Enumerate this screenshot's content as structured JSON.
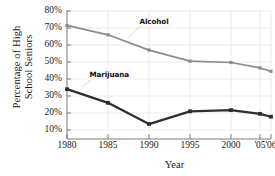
{
  "chart_data": {
    "type": "line",
    "title": "",
    "xlabel": "Year",
    "ylabel": "Percentage of High School Seniors",
    "ylabel_line1": "Percentage of High",
    "ylabel_line2": "School Seniors",
    "x": [
      1980,
      1985,
      1990,
      1995,
      2000,
      2005,
      2006
    ],
    "categories": [
      "1980",
      "1985",
      "1990",
      "1995",
      "2000",
      "'05",
      "'06"
    ],
    "xtick_labels": [
      "1980",
      "1985",
      "1990",
      "1995",
      "2000",
      "'05",
      "'06"
    ],
    "ytick_labels": [
      "80%",
      "70%",
      "60%",
      "50%",
      "40%",
      "30%",
      "20%",
      "10%"
    ],
    "ytick_values": [
      80,
      70,
      60,
      50,
      40,
      30,
      20,
      10
    ],
    "ylim": [
      5,
      83
    ],
    "grid": true,
    "grid_axis": "both",
    "legend": "inline-annotations",
    "series": [
      {
        "name": "Alcohol",
        "color": "#8c8c8c",
        "marker": "square",
        "values": [
          71.5,
          66.0,
          57.0,
          50.5,
          49.7,
          46.5,
          44.5
        ]
      },
      {
        "name": "Marijuana",
        "color": "#2e2e2e",
        "marker": "square",
        "values": [
          34.0,
          26.0,
          13.5,
          21.0,
          21.7,
          19.5,
          17.8
        ]
      }
    ],
    "annotations": [
      {
        "text": "Alcohol",
        "series": "Alcohol",
        "leader_to_x": 1990
      },
      {
        "text": "Marijuana",
        "series": "Marijuana",
        "leader_to_x": 1985
      }
    ]
  },
  "colors": {
    "alcohol": "#8c8c8c",
    "marijuana": "#2e2e2e",
    "axis": "#7a7a7a",
    "grid": "#e3e3e3",
    "text": "#1a1a1a",
    "background": "#ffffff"
  }
}
